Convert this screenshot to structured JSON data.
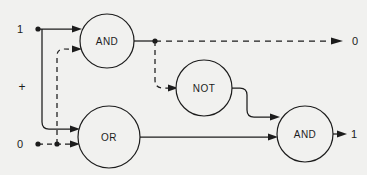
{
  "diagram": {
    "type": "logic-gate-network",
    "background_color": "#f1f1ef",
    "stroke_color": "#1c1c1c",
    "width": 367,
    "height": 175,
    "gates": [
      {
        "id": "and-top",
        "label": "AND",
        "cx": 107,
        "cy": 41,
        "r": 27
      },
      {
        "id": "or",
        "label": "OR",
        "cx": 109,
        "cy": 137,
        "r": 31
      },
      {
        "id": "not",
        "label": "NOT",
        "cx": 204,
        "cy": 88,
        "r": 28
      },
      {
        "id": "and-right",
        "label": "AND",
        "cx": 305,
        "cy": 134,
        "r": 28
      }
    ],
    "inputs": [
      {
        "id": "input-1",
        "label": "1",
        "x": 20,
        "y": 29
      },
      {
        "id": "input-0",
        "label": "0",
        "x": 20,
        "y": 144
      }
    ],
    "operator": {
      "id": "plus-operator",
      "label": "+",
      "x": 22,
      "y": 87
    },
    "outputs": [
      {
        "id": "output-top",
        "label": "0",
        "x": 355,
        "y": 41,
        "signal_style": "dashed"
      },
      {
        "id": "output-right",
        "label": "1",
        "x": 354,
        "y": 134,
        "signal_style": "solid"
      }
    ],
    "junctions": [
      {
        "id": "junction-input-1",
        "x": 38,
        "y": 29
      },
      {
        "id": "junction-input-0",
        "x": 38,
        "y": 144
      },
      {
        "id": "junction-branch-0",
        "x": 57,
        "y": 144
      },
      {
        "id": "junction-and-out",
        "x": 155,
        "y": 41
      }
    ],
    "wires": [
      {
        "id": "wire-1-to-and",
        "style": "solid",
        "from": "input-1",
        "to": "and-top"
      },
      {
        "id": "wire-1-to-or",
        "style": "solid",
        "from": "input-1",
        "to": "or"
      },
      {
        "id": "wire-0-to-or",
        "style": "dashed",
        "from": "input-0",
        "to": "or"
      },
      {
        "id": "wire-0-to-and",
        "style": "dashed",
        "from": "input-0",
        "to": "and-top"
      },
      {
        "id": "wire-and-out-stub",
        "style": "solid",
        "from": "and-top",
        "to": "junction-and-out"
      },
      {
        "id": "wire-and-to-output-0",
        "style": "dashed",
        "from": "and-top",
        "to": "output-top"
      },
      {
        "id": "wire-and-to-not",
        "style": "dashed",
        "from": "and-top",
        "to": "not"
      },
      {
        "id": "wire-not-to-and",
        "style": "solid",
        "from": "not",
        "to": "and-right"
      },
      {
        "id": "wire-or-to-and",
        "style": "solid",
        "from": "or",
        "to": "and-right"
      },
      {
        "id": "wire-and-to-output-1",
        "style": "solid",
        "from": "and-right",
        "to": "output-right"
      }
    ]
  }
}
